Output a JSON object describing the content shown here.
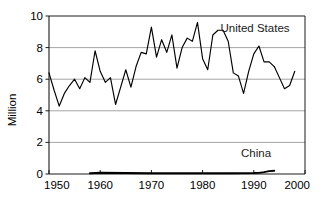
{
  "chart_data": {
    "type": "line",
    "title": "",
    "xlabel": "",
    "ylabel": "Million",
    "xlim": [
      1950,
      2000
    ],
    "ylim": [
      0,
      10
    ],
    "xticks": [
      1950,
      1960,
      1970,
      1980,
      1990,
      2000
    ],
    "yticks": [
      0,
      2,
      4,
      6,
      8,
      10
    ],
    "grid": "horizontal",
    "legend_position": "inline-annotations",
    "annotations": [
      {
        "text": "United States",
        "x": 1983.5,
        "y": 9.0
      },
      {
        "text": "China",
        "x": 1987.5,
        "y": 1.05
      }
    ],
    "series": [
      {
        "name": "United States",
        "color": "#000000",
        "x": [
          1950,
          1951,
          1952,
          1953,
          1954,
          1955,
          1956,
          1957,
          1958,
          1959,
          1960,
          1961,
          1962,
          1963,
          1964,
          1965,
          1966,
          1967,
          1968,
          1969,
          1970,
          1971,
          1972,
          1973,
          1974,
          1975,
          1976,
          1977,
          1978,
          1979,
          1980,
          1981,
          1982,
          1983,
          1984,
          1985,
          1986,
          1987,
          1988,
          1989,
          1990,
          1991,
          1992,
          1993,
          1994
        ],
        "values": [
          6.4,
          5.3,
          4.3,
          5.1,
          5.6,
          6.0,
          5.4,
          6.1,
          5.8,
          7.8,
          6.5,
          5.8,
          6.1,
          4.4,
          5.5,
          6.6,
          5.5,
          6.8,
          7.7,
          7.6,
          9.3,
          7.4,
          8.5,
          7.7,
          8.8,
          6.7,
          8.0,
          8.6,
          8.4,
          9.6,
          7.3,
          6.6,
          8.8,
          9.1,
          9.1,
          8.4,
          6.4,
          6.2,
          5.1,
          6.5,
          7.6,
          8.1,
          7.1,
          7.1,
          6.8
        ]
      },
      {
        "name": "United States",
        "color": "#000000",
        "x": [
          1994,
          1995,
          1996,
          1997,
          1998
        ],
        "values": [
          6.8,
          6.1,
          5.4,
          5.6,
          6.5
        ]
      },
      {
        "name": "China",
        "color": "#000000",
        "x": [
          1958,
          1960,
          1965,
          1970,
          1975,
          1980,
          1985,
          1990,
          1991,
          1992,
          1993,
          1994
        ],
        "values": [
          0.05,
          0.08,
          0.06,
          0.05,
          0.05,
          0.05,
          0.05,
          0.06,
          0.07,
          0.12,
          0.18,
          0.21
        ]
      }
    ]
  },
  "axis": {
    "y_title": "Million",
    "y_tick_labels": [
      "0",
      "2",
      "4",
      "6",
      "8",
      "10"
    ],
    "x_tick_labels": [
      "1950",
      "1960",
      "1970",
      "1980",
      "1990",
      "2000"
    ]
  },
  "labels": {
    "united_states": "United States",
    "china": "China"
  },
  "colors": {
    "line": "#000000",
    "grid": "#9a9a9a",
    "axis": "#1a1a1a",
    "background": "#ffffff"
  }
}
